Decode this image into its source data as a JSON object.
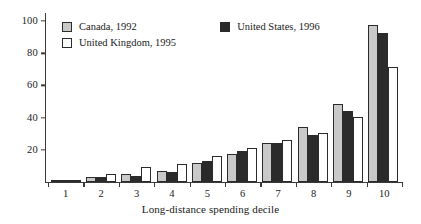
{
  "chart_data": {
    "type": "bar",
    "title": "",
    "xlabel": "Long-distance spending decile",
    "ylabel": "",
    "categories": [
      "1",
      "2",
      "3",
      "4",
      "5",
      "6",
      "7",
      "8",
      "9",
      "10"
    ],
    "series": [
      {
        "name": "Canada, 1992",
        "color": "#c9c9c9",
        "values": [
          1,
          3,
          5,
          7,
          12,
          17,
          24,
          34,
          48,
          97
        ]
      },
      {
        "name": "United States, 1996",
        "color": "#2b2b2b",
        "values": [
          1,
          3,
          4,
          6,
          13,
          19,
          24,
          29,
          44,
          92
        ]
      },
      {
        "name": "United Kingdom, 1995",
        "color": "#ffffff",
        "values": [
          1,
          5,
          9,
          11,
          16,
          21,
          26,
          30,
          40,
          71
        ]
      }
    ],
    "ylim": [
      0,
      105
    ],
    "yticks": [
      20,
      40,
      60,
      80,
      100
    ],
    "grid": false,
    "legend_position": "top-left-inside"
  },
  "axes": {
    "y_tick_labels": [
      "20",
      "40",
      "60",
      "80",
      "100"
    ],
    "x_tick_labels": [
      "1",
      "2",
      "3",
      "4",
      "5",
      "6",
      "7",
      "8",
      "9",
      "10"
    ],
    "x_axis_title": "Long-distance spending decile"
  },
  "legend": {
    "items": [
      {
        "label": "Canada, 1992",
        "swatch": "canada-swatch"
      },
      {
        "label": "United States, 1996",
        "swatch": "united-states-swatch"
      },
      {
        "label": "United Kingdom, 1995",
        "swatch": "united-kingdom-swatch"
      }
    ]
  },
  "colors": {
    "canada": "#c9c9c9",
    "united_states": "#2b2b2b",
    "united_kingdom": "#ffffff",
    "axis": "#3a3a3a",
    "outline": "#2b2b2b",
    "background": "#ffffff"
  }
}
